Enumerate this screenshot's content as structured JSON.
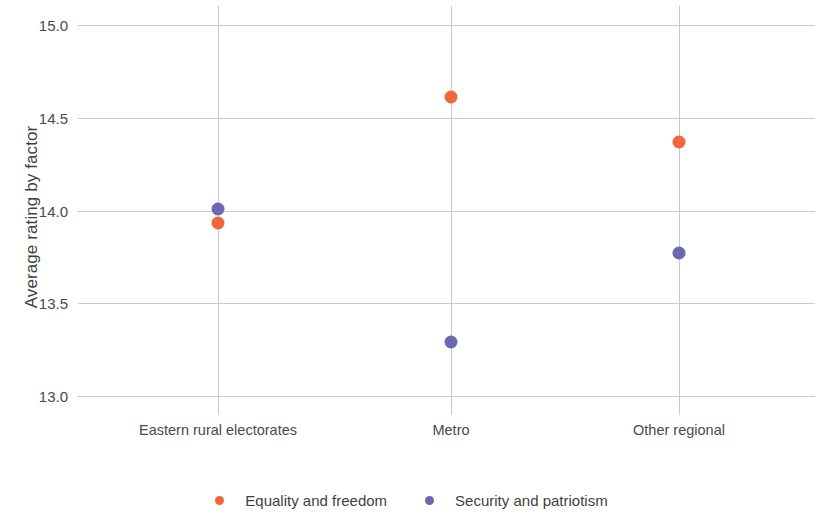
{
  "chart_data": {
    "type": "scatter",
    "title": "",
    "xlabel": "",
    "ylabel": "Average rating by factor",
    "categories": [
      "Eastern rural electorates",
      "Metro",
      "Other regional"
    ],
    "series": [
      {
        "name": "Equality and freedom",
        "color": "#F1663C",
        "values": [
          13.93,
          14.61,
          14.37
        ]
      },
      {
        "name": "Security and patriotism",
        "color": "#6B67B3",
        "values": [
          14.01,
          13.29,
          13.77
        ]
      }
    ],
    "ylim": [
      13.0,
      15.0
    ],
    "y_ticks": [
      "13.0",
      "13.5",
      "14.0",
      "14.5",
      "15.0"
    ],
    "y_tick_values": [
      13.0,
      13.5,
      14.0,
      14.5,
      15.0
    ],
    "grid": true,
    "legend_position": "bottom",
    "gridline_color": "#c9c9c9",
    "background_color": "#ffffff"
  },
  "legend": {
    "items": [
      {
        "label": "Equality and freedom",
        "color": "#F1663C"
      },
      {
        "label": "Security and patriotism",
        "color": "#6B67B3"
      }
    ]
  }
}
